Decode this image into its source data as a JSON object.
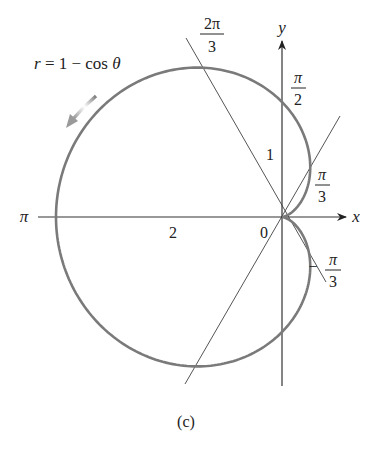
{
  "figure": {
    "equation": "r = 1 − cos θ",
    "caption": "(c)",
    "axes": {
      "x_label": "x",
      "y_label": "y",
      "origin_label": "0",
      "pi_label": "π"
    },
    "tick_labels": {
      "two": "2",
      "one": "1"
    },
    "angle_labels": {
      "two_pi_over_3": {
        "num": "2π",
        "den": "3"
      },
      "pi_over_2": {
        "num": "π",
        "den": "2"
      },
      "pi_over_3": {
        "num": "π",
        "den": "3"
      },
      "neg_pi_over_3": {
        "sign": "−",
        "num": "π",
        "den": "3"
      }
    },
    "colors": {
      "curve": "#7a7a7a",
      "axis": "#333333",
      "line": "#555555",
      "text": "#222222"
    }
  },
  "chart_data": {
    "type": "polar-curve",
    "title": "r = 1 − cos θ",
    "caption": "(c)",
    "equation": "r = 1 - cos(theta)",
    "xlabel": "x",
    "ylabel": "y",
    "marked_angles": [
      "2π/3",
      "π/2",
      "π/3",
      "-π/3",
      "π"
    ],
    "axis_ticks": {
      "x": [
        "2",
        "0"
      ],
      "y": [
        "1"
      ]
    },
    "reference_lines": [
      "θ = 2π/3",
      "θ = π/3"
    ],
    "key_points": [
      {
        "theta": "0",
        "r": 0,
        "x": 0,
        "y": 0
      },
      {
        "theta": "π/3",
        "r": 0.5,
        "x": 0.25,
        "y": 0.433
      },
      {
        "theta": "π/2",
        "r": 1,
        "x": 0,
        "y": 1
      },
      {
        "theta": "2π/3",
        "r": 1.5,
        "x": -0.75,
        "y": 1.299
      },
      {
        "theta": "π",
        "r": 2,
        "x": -2,
        "y": 0
      },
      {
        "theta": "-π/3",
        "r": 0.5,
        "x": 0.25,
        "y": -0.433
      }
    ],
    "direction_arrow": "counterclockwise along curve near upper-left"
  }
}
